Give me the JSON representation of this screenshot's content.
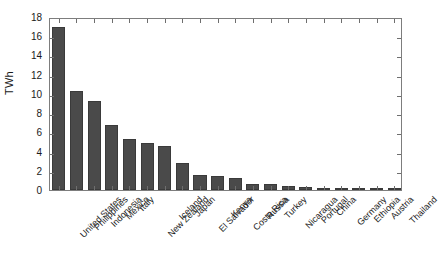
{
  "chart_data": {
    "type": "bar",
    "title": "",
    "subtitle": "",
    "xlabel": "",
    "ylabel": "TWh",
    "ylim": [
      0,
      18
    ],
    "ytick_step": 2,
    "yticks": [
      0,
      2,
      4,
      6,
      8,
      10,
      12,
      14,
      16,
      18
    ],
    "grid": false,
    "legend": null,
    "bar_color": "#4a4a4a",
    "bar_edge_color": "#3a3a3a",
    "frame_color": "#7d7d7d",
    "text_color": "#1a1a1a",
    "xtick_rotation": -45,
    "categories": [
      "United States",
      "Philippines",
      "Indonesia",
      "Mexico",
      "Italy",
      "New Zealand",
      "Iceland",
      "Japan",
      "El Salvador",
      "Kenya",
      "Costa Rica",
      "Russia",
      "Turkey",
      "Nicaragua",
      "Portugal",
      "China",
      "Germany",
      "Ethiopia",
      "Austria",
      "Thailand"
    ],
    "values": [
      17.0,
      10.35,
      9.3,
      6.75,
      5.35,
      4.85,
      4.55,
      2.85,
      1.6,
      1.45,
      1.3,
      0.65,
      0.6,
      0.4,
      0.28,
      0.22,
      0.16,
      0.04,
      0.03,
      0.02
    ]
  }
}
